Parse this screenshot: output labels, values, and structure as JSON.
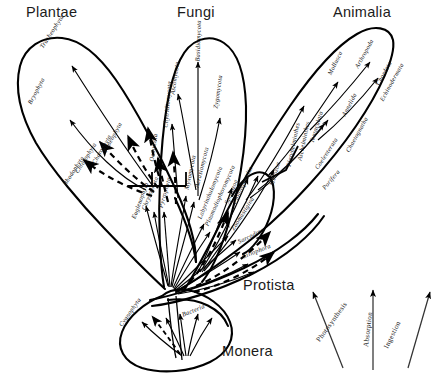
{
  "figure": {
    "type": "phylogenetic-diagram",
    "title_visible": false,
    "background_color": "#ffffff",
    "line_color": "#000000"
  },
  "kingdoms": [
    {
      "id": "plantae",
      "label": "Plantae",
      "x": 26,
      "y": 4
    },
    {
      "id": "fungi",
      "label": "Fungi",
      "x": 177,
      "y": 4
    },
    {
      "id": "animalia",
      "label": "Animalia",
      "x": 333,
      "y": 4
    },
    {
      "id": "protista",
      "label": "Protista",
      "x": 243,
      "y": 277
    },
    {
      "id": "monera",
      "label": "Monera",
      "x": 222,
      "y": 343
    }
  ],
  "phyla": [
    {
      "kingdom": "plantae",
      "label": "Tracheophyta",
      "x": 41,
      "y": 44,
      "rot": 57
    },
    {
      "kingdom": "plantae",
      "label": "Bryophyta",
      "x": 29,
      "y": 100,
      "rot": 62
    },
    {
      "kingdom": "plantae",
      "label": "Rhodophyta",
      "x": 64,
      "y": 181,
      "rot": 57
    },
    {
      "kingdom": "plantae",
      "label": "Chlorophyta",
      "x": 76,
      "y": 169,
      "rot": 58
    },
    {
      "kingdom": "plantae",
      "label": "Charophyta",
      "x": 93,
      "y": 160,
      "rot": 60
    },
    {
      "kingdom": "plantae",
      "label": "Phaeophyta",
      "x": 104,
      "y": 148,
      "rot": 61
    },
    {
      "kingdom": "protista",
      "label": "Chrysophyta",
      "x": 143,
      "y": 206,
      "rot": 68
    },
    {
      "kingdom": "protista",
      "label": "Euglenophyta",
      "x": 133,
      "y": 215,
      "rot": 70
    },
    {
      "kingdom": "protista",
      "label": "Pyrrophyta",
      "x": 160,
      "y": 204,
      "rot": 74
    },
    {
      "kingdom": "fungi",
      "label": "Oomycota",
      "x": 151,
      "y": 158,
      "rot": 82
    },
    {
      "kingdom": "fungi",
      "label": "Chytridiomycota",
      "x": 165,
      "y": 124,
      "rot": 85
    },
    {
      "kingdom": "fungi",
      "label": "Ascomycota",
      "x": 172,
      "y": 91,
      "rot": 82
    },
    {
      "kingdom": "fungi",
      "label": "Basidiomycota",
      "x": 197,
      "y": 58,
      "rot": 88
    },
    {
      "kingdom": "fungi",
      "label": "Zygomycota",
      "x": 215,
      "y": 105,
      "rot": 82
    },
    {
      "kingdom": "protista",
      "label": "Myxomycota",
      "x": 186,
      "y": 186,
      "rot": 78
    },
    {
      "kingdom": "protista",
      "label": "Acrasiomycota",
      "x": 196,
      "y": 184,
      "rot": 76
    },
    {
      "kingdom": "protista",
      "label": "Labyrinthulomycota",
      "x": 199,
      "y": 215,
      "rot": 68
    },
    {
      "kingdom": "protista",
      "label": "Plasmodiophoromycota",
      "x": 206,
      "y": 222,
      "rot": 66
    },
    {
      "kingdom": "protista",
      "label": "Sporozoa",
      "x": 226,
      "y": 200,
      "rot": 68
    },
    {
      "kingdom": "protista",
      "label": "Cnidosporidia",
      "x": 234,
      "y": 200,
      "rot": 66
    },
    {
      "kingdom": "protista",
      "label": "Zoomastigina",
      "x": 232,
      "y": 226,
      "rot": 58
    },
    {
      "kingdom": "protista",
      "label": "Sarcodina",
      "x": 238,
      "y": 238,
      "rot": 26
    },
    {
      "kingdom": "protista",
      "label": "Ciliophora",
      "x": 242,
      "y": 253,
      "rot": 22
    },
    {
      "kingdom": "animalia",
      "label": "Mesozoa",
      "x": 271,
      "y": 182,
      "rot": 74
    },
    {
      "kingdom": "animalia",
      "label": "Platyhelminthes",
      "x": 288,
      "y": 163,
      "rot": 78
    },
    {
      "kingdom": "animalia",
      "label": "Aschelminthes",
      "x": 299,
      "y": 157,
      "rot": 78
    },
    {
      "kingdom": "animalia",
      "label": "Tentaculata",
      "x": 311,
      "y": 139,
      "rot": 73
    },
    {
      "kingdom": "animalia",
      "label": "Mollusca",
      "x": 329,
      "y": 71,
      "rot": 64
    },
    {
      "kingdom": "animalia",
      "label": "Annelida",
      "x": 343,
      "y": 112,
      "rot": 62
    },
    {
      "kingdom": "animalia",
      "label": "Arthropoda",
      "x": 356,
      "y": 64,
      "rot": 61
    },
    {
      "kingdom": "animalia",
      "label": "Chaetognatha",
      "x": 347,
      "y": 148,
      "rot": 61
    },
    {
      "kingdom": "animalia",
      "label": "Chordata",
      "x": 377,
      "y": 81,
      "rot": 61
    },
    {
      "kingdom": "animalia",
      "label": "Echinodermata",
      "x": 381,
      "y": 97,
      "rot": 61
    },
    {
      "kingdom": "animalia",
      "label": "Coelenterata",
      "x": 316,
      "y": 165,
      "rot": 57
    },
    {
      "kingdom": "animalia",
      "label": "Porifera",
      "x": 323,
      "y": 185,
      "rot": 50
    },
    {
      "kingdom": "monera",
      "label": "Cyanophyta",
      "x": 120,
      "y": 322,
      "rot": 55
    },
    {
      "kingdom": "monera",
      "label": "Bacteria",
      "x": 182,
      "y": 311,
      "rot": 22
    }
  ],
  "legend": {
    "arrows": [
      {
        "id": "photosynthesis",
        "label": "Photosynthesis",
        "x": 318,
        "y": 337,
        "rot": 54
      },
      {
        "id": "absorption",
        "label": "Absorption",
        "x": 366,
        "y": 343,
        "rot": 83
      },
      {
        "id": "ingestion",
        "label": "Ingestion",
        "x": 386,
        "y": 344,
        "rot": 64
      }
    ]
  }
}
